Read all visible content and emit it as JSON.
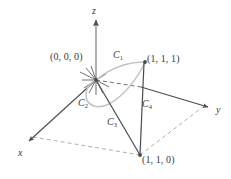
{
  "figure": {
    "background_color": "#ffffff",
    "line_color": "#4a4a52",
    "highlight_curve_color": "#b9b9bd",
    "dashed_color": "#9a9aa2",
    "label_color": "#3a3a42",
    "axes": [
      {
        "name": "z",
        "label": "z",
        "x": 92,
        "y": 6
      },
      {
        "name": "y",
        "label": "y",
        "x": 216,
        "y": 105
      },
      {
        "name": "x",
        "label": "x",
        "x": 18,
        "y": 148
      }
    ],
    "points": [
      {
        "name": "origin",
        "label": "(0, 0, 0)",
        "x": 50,
        "y": 52
      },
      {
        "name": "top-corner",
        "label": "(1, 1, 1)",
        "x": 147,
        "y": 54
      },
      {
        "name": "base-corner",
        "label": "(1, 1, 0)",
        "x": 142,
        "y": 155
      }
    ],
    "curves": [
      {
        "name": "C1",
        "label": "C",
        "sub": "1",
        "x": 113,
        "y": 50
      },
      {
        "name": "C2",
        "label": "C",
        "sub": "2",
        "x": 78,
        "y": 98
      },
      {
        "name": "C3",
        "label": "C",
        "sub": "3",
        "x": 107,
        "y": 117
      },
      {
        "name": "C4",
        "label": "C",
        "sub": "4",
        "x": 142,
        "y": 99
      }
    ]
  }
}
